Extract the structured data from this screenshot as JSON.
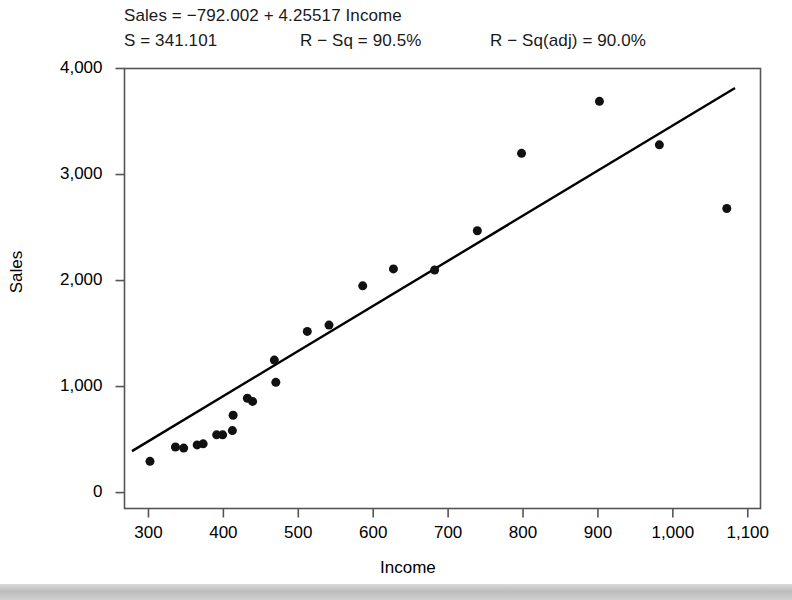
{
  "annotations": {
    "equation": "Sales = −792.002 + 4.25517 Income",
    "s_label": "S = 341.101",
    "rsq_label": "R − Sq = 90.5%",
    "rsq_adj_label": "R − Sq(adj) = 90.0%"
  },
  "chart_data": {
    "type": "scatter",
    "title": "",
    "xlabel": "Income",
    "ylabel": "Sales",
    "xlim": [
      268,
      1117
    ],
    "ylim": [
      -150,
      4000
    ],
    "grid": false,
    "legend": "none",
    "xticks": [
      300,
      400,
      500,
      600,
      700,
      800,
      900,
      1000,
      1100
    ],
    "xtick_labels": [
      "300",
      "400",
      "500",
      "600",
      "700",
      "800",
      "900",
      "1,000",
      "1,100"
    ],
    "yticks": [
      0,
      1000,
      2000,
      3000,
      4000
    ],
    "ytick_labels": [
      "0",
      "1,000",
      "2,000",
      "3,000",
      "4,000"
    ],
    "marker": {
      "shape": "circle",
      "color": "#111111",
      "size": 9
    },
    "points": [
      {
        "x": 302,
        "y": 295
      },
      {
        "x": 336,
        "y": 430
      },
      {
        "x": 347,
        "y": 420
      },
      {
        "x": 365,
        "y": 450
      },
      {
        "x": 373,
        "y": 460
      },
      {
        "x": 391,
        "y": 545
      },
      {
        "x": 399,
        "y": 545
      },
      {
        "x": 412,
        "y": 585
      },
      {
        "x": 413,
        "y": 730
      },
      {
        "x": 432,
        "y": 890
      },
      {
        "x": 439,
        "y": 860
      },
      {
        "x": 470,
        "y": 1040
      },
      {
        "x": 468,
        "y": 1250
      },
      {
        "x": 512,
        "y": 1520
      },
      {
        "x": 541,
        "y": 1580
      },
      {
        "x": 586,
        "y": 1950
      },
      {
        "x": 627,
        "y": 2110
      },
      {
        "x": 682,
        "y": 2100
      },
      {
        "x": 739,
        "y": 2470
      },
      {
        "x": 798,
        "y": 3200
      },
      {
        "x": 902,
        "y": 3690
      },
      {
        "x": 982,
        "y": 3280
      },
      {
        "x": 1072,
        "y": 2680
      }
    ],
    "fit_line": {
      "label": "regression-line",
      "intercept": -792.002,
      "slope": 4.25517,
      "color": "#000000",
      "x_start": 278,
      "x_end": 1083
    }
  }
}
